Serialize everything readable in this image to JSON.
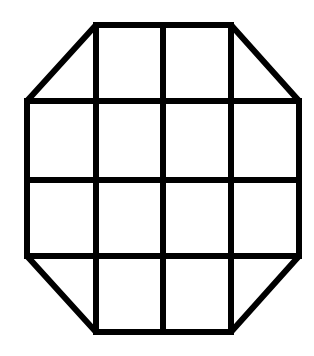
{
  "figure": {
    "stroke_color": "#000000",
    "background_color": "#ffffff",
    "stroke_width": 6,
    "grid": {
      "columns_x": [
        27,
        96,
        163,
        231,
        299
      ],
      "rows_y": [
        25,
        101,
        180,
        256,
        332
      ]
    },
    "outline_points": [
      [
        96,
        25
      ],
      [
        231,
        25
      ],
      [
        299,
        101
      ],
      [
        299,
        256
      ],
      [
        231,
        332
      ],
      [
        96,
        332
      ],
      [
        27,
        256
      ],
      [
        27,
        101
      ]
    ],
    "inner_lines": [
      {
        "id": "v1",
        "x1": 96,
        "y1": 25,
        "x2": 96,
        "y2": 332
      },
      {
        "id": "v2",
        "x1": 163,
        "y1": 25,
        "x2": 163,
        "y2": 332
      },
      {
        "id": "v3",
        "x1": 231,
        "y1": 25,
        "x2": 231,
        "y2": 332
      },
      {
        "id": "h1",
        "x1": 27,
        "y1": 101,
        "x2": 299,
        "y2": 101
      },
      {
        "id": "h2",
        "x1": 27,
        "y1": 180,
        "x2": 299,
        "y2": 180
      },
      {
        "id": "h3",
        "x1": 27,
        "y1": 256,
        "x2": 299,
        "y2": 256
      }
    ],
    "cell_count": {
      "squares": 12,
      "triangles": 4
    }
  }
}
